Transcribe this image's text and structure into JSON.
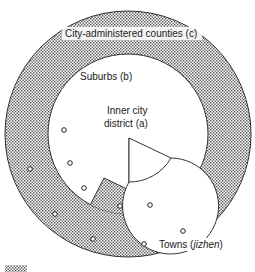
{
  "diagram": {
    "type": "concentric-zones",
    "zones": [
      {
        "id": "c",
        "label": "City-administered counties (c)",
        "fill": "dotted-grey"
      },
      {
        "id": "b",
        "label": "Suburbs (b)",
        "fill": "white"
      },
      {
        "id": "a",
        "label_line1": "Inner city",
        "label_line2": "district (a)",
        "fill": "white"
      }
    ],
    "labels": {
      "counties": "City-administered counties (c)",
      "suburbs": "Suburbs (b)",
      "inner_line1": "Inner city",
      "inner_line2": "district (a)",
      "towns_prefix": "Towns (",
      "towns_italic": "jizhen",
      "towns_suffix": ")"
    },
    "towns": [
      {
        "x": 64,
        "y": 130
      },
      {
        "x": 30,
        "y": 169
      },
      {
        "x": 70,
        "y": 163
      },
      {
        "x": 84,
        "y": 188
      },
      {
        "x": 55,
        "y": 214
      },
      {
        "x": 120,
        "y": 206
      },
      {
        "x": 150,
        "y": 205
      },
      {
        "x": 183,
        "y": 231
      },
      {
        "x": 93,
        "y": 239
      },
      {
        "x": 144,
        "y": 244
      }
    ],
    "colors": {
      "ink": "#1a1a1a",
      "dot_fill": "#555555",
      "background": "#ffffff"
    }
  }
}
